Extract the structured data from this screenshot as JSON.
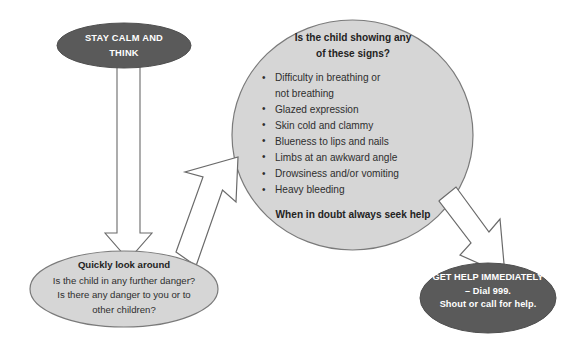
{
  "diagram": {
    "colors": {
      "dark_ellipse_fill": "#5a5a5a",
      "light_ellipse_fill": "#d6d6d6",
      "ellipse_stroke": "#6e6e6e",
      "arrow_fill": "#ffffff",
      "arrow_stroke": "#555555",
      "page_background": "#ffffff",
      "dark_text": "#2e2e2e",
      "light_text": "#ffffff"
    },
    "nodes": {
      "stay_calm": {
        "line1": "STAY CALM AND",
        "line2": "THINK"
      },
      "signs": {
        "title_line1": "Is the child showing any",
        "title_line2": "of these signs?",
        "items": [
          {
            "line1": "Difficulty in breathing or",
            "line2": "not breathing"
          },
          {
            "line1": "Glazed expression",
            "line2": ""
          },
          {
            "line1": "Skin cold and clammy",
            "line2": ""
          },
          {
            "line1": "Blueness to lips and nails",
            "line2": ""
          },
          {
            "line1": "Limbs at an awkward angle",
            "line2": ""
          },
          {
            "line1": "Drowsiness and/or vomiting",
            "line2": ""
          },
          {
            "line1": "Heavy bleeding",
            "line2": ""
          }
        ],
        "footer": "When in doubt always seek help"
      },
      "look_around": {
        "title": "Quickly look around",
        "line1": "Is the child in any further danger?",
        "line2": "Is there any danger to you or to",
        "line3": "other children?"
      },
      "get_help": {
        "line1": "GET HELP IMMEDIATELY",
        "line2": "– Dial 999.",
        "line3": "Shout or call for help."
      }
    },
    "arrows": [
      {
        "name": "stay-calm-to-look-around",
        "direction": "down"
      },
      {
        "name": "look-around-to-signs",
        "direction": "up-right"
      },
      {
        "name": "signs-to-get-help",
        "direction": "down-right"
      }
    ]
  }
}
